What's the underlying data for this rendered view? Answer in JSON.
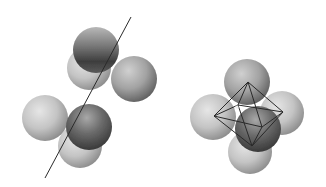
{
  "figure": {
    "panels": [
      {
        "name": "linear-arrangement",
        "sphere_count": 6,
        "has_axis_line": true
      },
      {
        "name": "octahedral-arrangement",
        "sphere_count": 6,
        "has_octahedron_wireframe": true
      }
    ],
    "colors": {
      "background": "#ffffff",
      "sphere_light": "#d6d6d6",
      "sphere_mid": "#9a9a9a",
      "sphere_dark": "#4a4a4a",
      "line": "#2a2a2a"
    }
  }
}
